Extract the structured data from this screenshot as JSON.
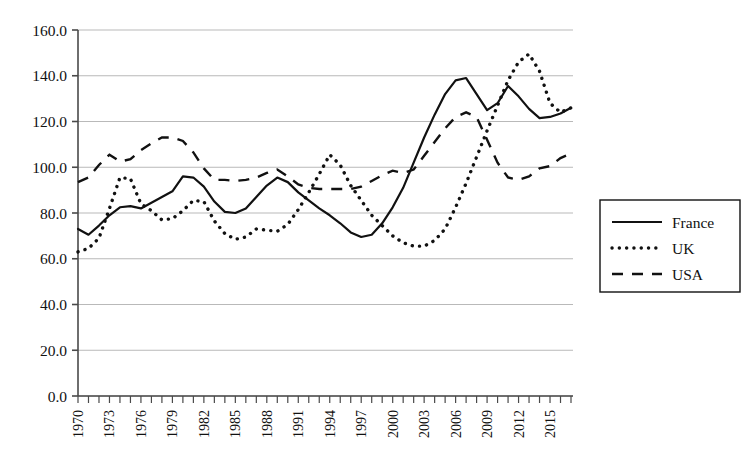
{
  "chart_data": {
    "type": "line",
    "title": "",
    "xlabel": "",
    "ylabel": "",
    "xlim": [
      1970,
      2017
    ],
    "ylim": [
      0,
      160
    ],
    "ytick_step": 20,
    "grid": true,
    "legend_position": "right",
    "x": [
      1970,
      1971,
      1972,
      1973,
      1974,
      1975,
      1976,
      1977,
      1978,
      1979,
      1980,
      1981,
      1982,
      1983,
      1984,
      1985,
      1986,
      1987,
      1988,
      1989,
      1990,
      1991,
      1992,
      1993,
      1994,
      1995,
      1996,
      1997,
      1998,
      1999,
      2000,
      2001,
      2002,
      2003,
      2004,
      2005,
      2006,
      2007,
      2008,
      2009,
      2010,
      2011,
      2012,
      2013,
      2014,
      2015,
      2016,
      2017
    ],
    "xtick_labels": [
      "1970",
      "1973",
      "1976",
      "1979",
      "1982",
      "1985",
      "1988",
      "1991",
      "1994",
      "1997",
      "2000",
      "2003",
      "2006",
      "2009",
      "2012",
      "2015"
    ],
    "ytick_labels": [
      "0.0",
      "20.0",
      "40.0",
      "60.0",
      "80.0",
      "100.0",
      "120.0",
      "140.0",
      "160.0"
    ],
    "series": [
      {
        "name": "France",
        "style": "solid",
        "color": "#111111",
        "values": [
          73.0,
          70.5,
          74.5,
          79.0,
          82.5,
          83.0,
          82.0,
          84.5,
          87.0,
          89.5,
          96.0,
          95.5,
          91.5,
          85.0,
          80.5,
          80.0,
          82.0,
          87.0,
          92.0,
          95.5,
          93.5,
          89.0,
          85.5,
          82.0,
          79.0,
          75.5,
          71.5,
          69.5,
          70.5,
          75.5,
          82.5,
          91.0,
          102.0,
          113.0,
          123.0,
          132.0,
          138.0,
          139.0,
          132.0,
          125.0,
          128.0,
          135.5,
          131.0,
          125.5,
          121.5,
          122.0,
          123.5,
          126.0
        ]
      },
      {
        "name": "UK",
        "style": "dotted",
        "color": "#111111",
        "values": [
          63.0,
          64.5,
          69.0,
          82.0,
          95.5,
          95.0,
          84.0,
          81.0,
          77.0,
          77.5,
          81.0,
          85.5,
          85.0,
          76.5,
          71.0,
          68.5,
          69.5,
          73.0,
          72.5,
          72.0,
          75.0,
          81.5,
          89.0,
          97.0,
          105.5,
          101.0,
          92.0,
          85.5,
          79.0,
          74.5,
          70.0,
          67.0,
          65.5,
          65.5,
          68.0,
          73.0,
          82.5,
          93.0,
          104.5,
          116.0,
          127.0,
          138.0,
          146.0,
          149.5,
          142.0,
          128.0,
          124.0,
          126.0
        ]
      },
      {
        "name": "USA",
        "style": "dashed",
        "color": "#111111",
        "values": [
          93.5,
          95.5,
          101.0,
          105.5,
          102.5,
          103.5,
          107.5,
          110.5,
          113.0,
          113.0,
          111.5,
          106.5,
          99.5,
          94.5,
          94.5,
          94.0,
          94.5,
          95.5,
          97.5,
          99.0,
          96.0,
          92.5,
          91.0,
          90.5,
          90.5,
          90.5,
          90.5,
          91.5,
          94.0,
          96.5,
          98.5,
          97.5,
          99.0,
          105.0,
          111.0,
          117.0,
          122.0,
          124.0,
          122.0,
          112.0,
          102.0,
          95.5,
          94.5,
          96.0,
          99.5,
          100.5,
          104.0,
          106.0
        ]
      }
    ]
  },
  "legend": {
    "items": [
      {
        "label": "France",
        "style": "solid"
      },
      {
        "label": "UK",
        "style": "dotted"
      },
      {
        "label": "USA",
        "style": "dashed"
      }
    ]
  }
}
